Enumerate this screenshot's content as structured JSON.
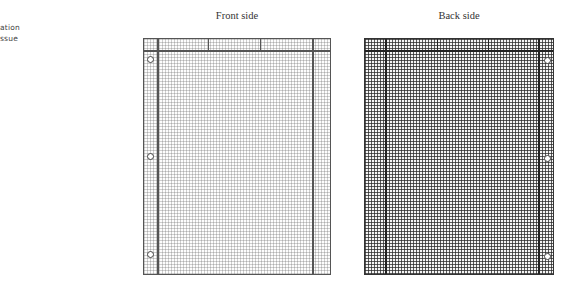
{
  "side_note": {
    "lines": [
      "ation",
      "ssue"
    ]
  },
  "figure": {
    "front": {
      "caption": "Front side",
      "grid": "light",
      "hole_positions": [
        "top",
        "middle",
        "bottom"
      ],
      "hole_side": "left"
    },
    "back": {
      "caption": "Back side",
      "grid": "dark",
      "hole_positions": [
        "top",
        "middle",
        "bottom"
      ],
      "hole_side": "right"
    }
  }
}
